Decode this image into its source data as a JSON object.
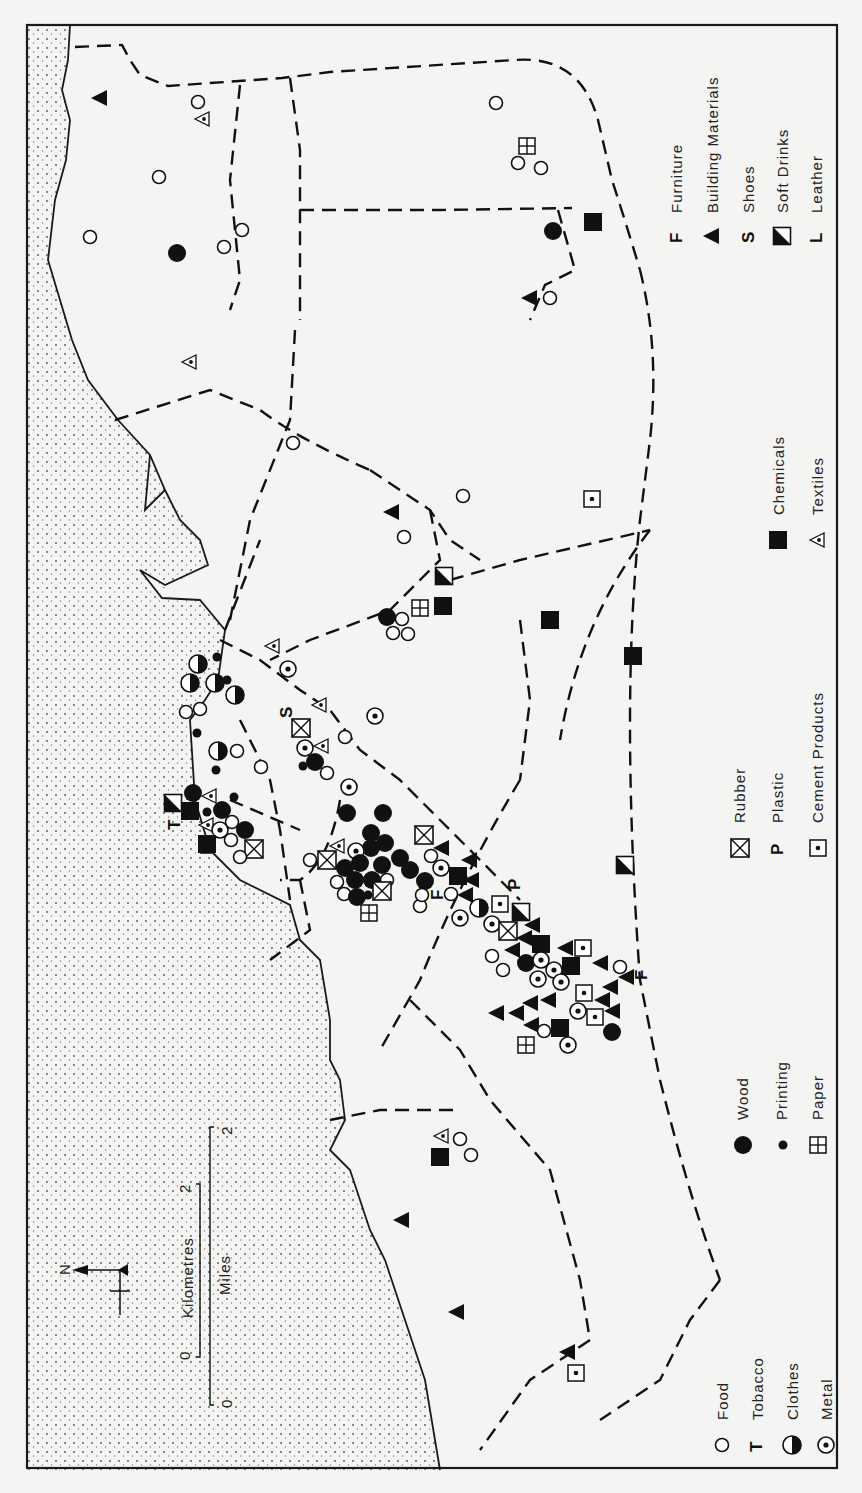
{
  "figure": {
    "orientation": "rotated 90° counter-clockwise",
    "north_arrow": {
      "label": "N"
    },
    "scale_bar": {
      "kilometres": {
        "label": "Kilometres",
        "start": "0",
        "end": "2"
      },
      "miles": {
        "label": "Miles",
        "start": "0",
        "end": "2"
      }
    }
  },
  "legend": {
    "items": [
      {
        "key": "food",
        "label": "Food",
        "symbol": "open-circle"
      },
      {
        "key": "tobacco",
        "label": "Tobacco",
        "symbol": "T"
      },
      {
        "key": "clothes",
        "label": "Clothes",
        "symbol": "half-filled-circle"
      },
      {
        "key": "metal",
        "label": "Metal",
        "symbol": "dotted-circle"
      },
      {
        "key": "wood",
        "label": "Wood",
        "symbol": "filled-circle"
      },
      {
        "key": "printing",
        "label": "Printing",
        "symbol": "small-dot"
      },
      {
        "key": "paper",
        "label": "Paper",
        "symbol": "quartered-square"
      },
      {
        "key": "rubber",
        "label": "Rubber",
        "symbol": "crossed-square"
      },
      {
        "key": "plastic",
        "label": "Plastic",
        "symbol": "P"
      },
      {
        "key": "cement",
        "label": "Cement Products",
        "symbol": "dotted-square"
      },
      {
        "key": "chemicals",
        "label": "Chemicals",
        "symbol": "filled-square"
      },
      {
        "key": "textiles",
        "label": "Textiles",
        "symbol": "dotted-triangle"
      },
      {
        "key": "furniture",
        "label": "Furniture",
        "symbol": "F"
      },
      {
        "key": "building",
        "label": "Building Materials",
        "symbol": "filled-triangle"
      },
      {
        "key": "shoes",
        "label": "Shoes",
        "symbol": "S"
      },
      {
        "key": "softdrinks",
        "label": "Soft Drinks",
        "symbol": "half-filled-square"
      },
      {
        "key": "leather",
        "label": "Leather",
        "symbol": "L"
      }
    ]
  },
  "map_labels": {
    "S": "S",
    "F": "F",
    "P": "P",
    "T": "T",
    "L": "L"
  },
  "colors": {
    "ink": "#111111",
    "paper": "#f4f4f2"
  }
}
